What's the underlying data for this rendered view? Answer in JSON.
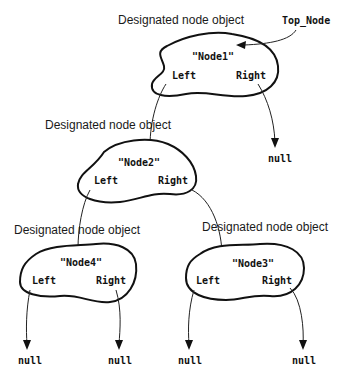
{
  "diagram": {
    "pointer": {
      "label": "Top_Node"
    },
    "caption_label": "Designated node object",
    "null_label": "null",
    "nodes": [
      {
        "id": "node1",
        "value": "\"Node1\"",
        "caption": "Designated node object",
        "left_label": "Left",
        "right_label": "Right"
      },
      {
        "id": "node2",
        "value": "\"Node2\"",
        "caption": "Designated node object",
        "left_label": "Left",
        "right_label": "Right"
      },
      {
        "id": "node4",
        "value": "\"Node4\"",
        "caption": "Designated node object",
        "left_label": "Left",
        "right_label": "Right"
      },
      {
        "id": "node3",
        "value": "\"Node3\"",
        "caption": "Designated node object",
        "left_label": "Left",
        "right_label": "Right"
      }
    ],
    "edges": [
      {
        "from": "Top_Node",
        "to": "node1"
      },
      {
        "from": "node1.Left",
        "to": "node2"
      },
      {
        "from": "node1.Right",
        "to": "null"
      },
      {
        "from": "node2.Left",
        "to": "node4"
      },
      {
        "from": "node2.Right",
        "to": "node3"
      },
      {
        "from": "node4.Left",
        "to": "null"
      },
      {
        "from": "node4.Right",
        "to": "null"
      },
      {
        "from": "node3.Left",
        "to": "null"
      },
      {
        "from": "node3.Right",
        "to": "null"
      }
    ],
    "nulls": [
      {
        "id": "null-node1-right",
        "label": "null"
      },
      {
        "id": "null-node4-left",
        "label": "null"
      },
      {
        "id": "null-node4-right",
        "label": "null"
      },
      {
        "id": "null-node3-left",
        "label": "null"
      },
      {
        "id": "null-node3-right",
        "label": "null"
      }
    ],
    "colors": {
      "stroke": "#111111",
      "background": "#ffffff",
      "text": "#1a1a1a"
    }
  }
}
